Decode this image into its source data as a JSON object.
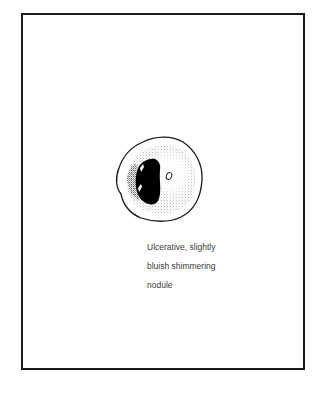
{
  "figure": {
    "caption": {
      "lines": [
        "Ulcerative, slightly",
        "bluish shimmering",
        "nodule"
      ]
    },
    "illustration": {
      "subject": "nodule-lesion",
      "outline_color": "#1a1a1a",
      "stipple_color": "#555555",
      "ulcer_fill": "#000000"
    }
  }
}
